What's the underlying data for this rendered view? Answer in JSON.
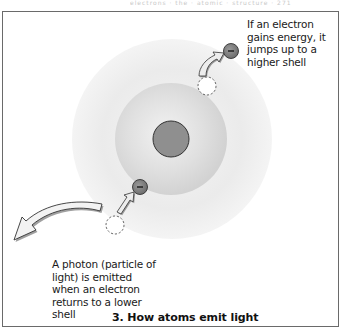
{
  "header": {
    "faded_text": "electrons · the · atomic · structure · 271"
  },
  "annotations": {
    "excitation": "If an electron gains energy, it jumps up to a higher shell",
    "emission": "A photon (particle of light) is emitted when an electron returns to a lower shell"
  },
  "caption": "3. How atoms emit light",
  "diagram": {
    "nucleus": {
      "cx": 171,
      "cy": 139,
      "r": 18,
      "fill": "#8e8e8e"
    },
    "inner_shell": {
      "cx": 171,
      "cy": 139,
      "r": 56,
      "fill": "#d9d9d9"
    },
    "outer_shell": {
      "cx": 172,
      "cy": 139,
      "r": 100,
      "fill": "#ececec"
    },
    "electrons": [
      {
        "name": "upper-electron",
        "cx": 231,
        "cy": 50,
        "r": 7.5,
        "symbol": "−"
      },
      {
        "name": "lower-electron",
        "cx": 140,
        "cy": 187,
        "r": 7.5,
        "symbol": "−"
      }
    ],
    "vacancies": [
      {
        "name": "upper-vacancy",
        "cx": 209,
        "cy": 85,
        "r": 9
      },
      {
        "name": "lower-vacancy",
        "cx": 115,
        "cy": 225,
        "r": 9
      }
    ],
    "colors": {
      "electron": "#7d7d7d",
      "arrow_fill": "#e9e9e9",
      "arrow_shadow": "#9a9a9a",
      "outline": "#3a3a3a"
    }
  }
}
